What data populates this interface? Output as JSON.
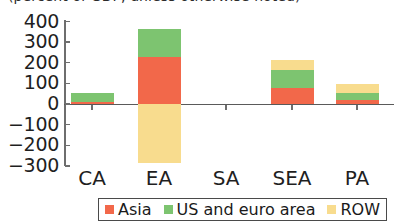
{
  "chart_data": {
    "type": "bar",
    "title": "(percent of GDP, unless otherwise noted)",
    "subtitle": "",
    "xlabel": "",
    "ylabel": "",
    "stacked": true,
    "grid": false,
    "legend_position": "bottom",
    "ylim": [
      -300,
      400
    ],
    "yticks": [
      400,
      300,
      200,
      100,
      0,
      -100,
      -200,
      -300
    ],
    "ytick_labels": [
      "400",
      "300",
      "200",
      "100",
      "0",
      "−100",
      "−200",
      "−300"
    ],
    "categories": [
      "CA",
      "EA",
      "SA",
      "SEA",
      "PA"
    ],
    "series": [
      {
        "name": "Asia",
        "color": "#F2684A",
        "values": [
          10,
          230,
          0,
          80,
          20
        ]
      },
      {
        "name": "US and euro area",
        "color": "#7DC470",
        "values": [
          45,
          135,
          0,
          85,
          35
        ]
      },
      {
        "name": "ROW",
        "color": "#F8DC8E",
        "values": [
          0,
          -285,
          0,
          50,
          40
        ]
      }
    ],
    "legend": [
      {
        "label": "Asia",
        "color": "#F2684A"
      },
      {
        "label": "US and euro area",
        "color": "#7DC470"
      },
      {
        "label": "ROW",
        "color": "#F8DC8E"
      }
    ]
  },
  "axis": {
    "line_color": "#6e6e6e",
    "zero_line_color": "#5a5a5a"
  }
}
